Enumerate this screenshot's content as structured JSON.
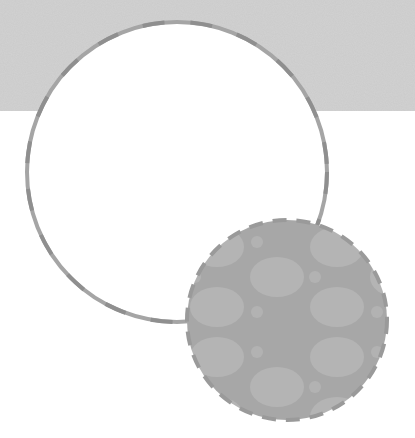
{
  "colors": {
    "background": "#ffffff",
    "band": "#d2d2d2",
    "band_speckle": "#c4c4c4",
    "outline": "#9e9e9e",
    "outline_dash": "#8a8a8a",
    "small_circle_fill": "#a9a9a9",
    "small_circle_blob": "#b6b6b6",
    "large_circle_fill": "#ffffff"
  },
  "shapes": {
    "band": {
      "x": 0,
      "y": 0,
      "width": 415,
      "height": 111
    },
    "large_circle": {
      "cx": 177,
      "cy": 172,
      "r": 150
    },
    "small_circle": {
      "cx": 287,
      "cy": 320,
      "r": 100
    }
  }
}
